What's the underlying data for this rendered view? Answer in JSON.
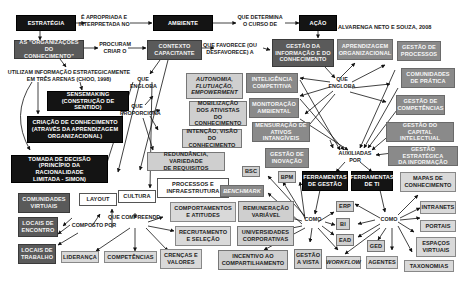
{
  "citation": "ALVARENGA NETO E SOUZA, 2008",
  "nodes": {
    "estrategia": "ESTRATÉGIA",
    "ambiente": "AMBIENTE",
    "acao": "AÇÃO",
    "organizacoes": "AS \"ORGANIZAÇÕES DO\nCONHECIMENTO\"",
    "contexto": "CONTEXTO\nCAPACITANTE",
    "gestao_info": "GESTÃO DA\nINFORMAÇÃO E DO\nCONHECIMENTO",
    "aprendizagem": "APRENDIZAGEM\nORGANIZACIONAL",
    "gestao_processos": "GESTÃO DE\nPROCESSOS",
    "comunidades_pratica": "COMUNIDADES\nDE PRÁTICA",
    "gestao_competencias": "GESTÃO DE\nCOMPETÊNCIAS",
    "capital_intelectual": "GESTÃO DO\nCAPITAL INTELECTUAL",
    "gestao_estrategica": "GESTÃO ESTRATÉGICA\nDA INFORMAÇÃO",
    "inteligencia": "INTELIGÊNCIA\nCOMPETITIVA",
    "monitoracao": "MONITORAÇÃO\nAMBIENTAL",
    "mensuracao": "MENSURAÇÃO DE\nATIVOS INTANGÍVEIS",
    "inovacao": "GESTÃO DE\nINOVAÇÃO",
    "autonomia": "AUTONOMIA,\nFLUTUAÇÃO,\nEMPOWERMENT",
    "mobilizacao": "MOBILIZAÇÃO\nDOS ATIVISTAS DO\nCONHECIMENTO",
    "intencao": "INTENÇÃO, VISÃO\nDO CONHECIMENTO",
    "redundancia": "REDUNDÂNCIA, VARIEDADE\nDE REQUISITOS",
    "sensemaking": "SENSEMAKING\n(CONSTRUÇÃO DE SENTIDO)",
    "criacao": "CRIAÇÃO DE CONHECIMENTO\n(ATRAVÉS DA APRENDIZAGEM\nORGANIZACIONAL)",
    "tomada": "TOMADA DE DECISÃO\n(PRINCÍPIO DA RACIONALIDADE\nLIMITADA - SIMON)",
    "comunidades_virtuais": "COMUNIDADES\nVIRTUAIS",
    "locais_encontro": "LOCAIS DE\nENCONTRO",
    "locais_trabalho": "LOCAIS DE\nTRABALHO",
    "layout": "LAYOUT",
    "cultura": "CULTURA",
    "processos_infra": "PROCESSOS E\nINFRAESTRUTURA",
    "lideranca": "LIDERANÇA",
    "competencias": "COMPETÊNCIAS",
    "crencas": "CRENÇAS E\nVALORES",
    "comportamentos": "COMPORTAMENTOS\nE ATITUDES",
    "recrutamento": "RECRUTAMENTO\nE SELEÇÃO",
    "benchmark": "BENCHMARK",
    "bsc": "BSC",
    "bpm": "BPM",
    "remuneracao": "REMUNERAÇÃO\nVARIÁVEL",
    "universidades": "UNIVERSIDADES\nCORPORATIVAS",
    "incentivo": "INCENTIVO AO\nCOMPARTILHAMENTO",
    "gestao_vista": "GESTÃO\nA VISTA",
    "ferr_gestao": "FERRAMENTAS\nDE GESTÃO",
    "ferr_ti": "FERRAMENTAS\nDE TI",
    "mapas": "MAPAS DE\nCONHECIMENTO",
    "erp": "ERP",
    "bi": "BI",
    "ead": "EAD",
    "ged": "GED",
    "workflow": "WORKFLOW",
    "agentes": "AGENTES",
    "intranets": "INTRANETS",
    "portais": "PORTAIS",
    "espacos": "ESPAÇOS\nVIRTUAIS",
    "taxonomias": "TAXONOMIAS"
  },
  "labels": {
    "apropriada": "É APROPRIADA E\nINTERPRETADA NO",
    "determina": "QUE DETERMINA\nO CURSO DE",
    "procuram": "PROCURAM\nCRIAR O",
    "favorece": "QUE FAVORECE (OU\nDESFAVORECE) A",
    "utilizam": "UTILIZAM INFORMAÇÃO ESTRATEGICAMENTE\nEM TRÊS ARENAS (CHOO, 1998)",
    "engloba1": "QUE\nENGLOBA",
    "proporciona": "QUE\nPROPORCIONA",
    "engloba2": "QUE\nENGLOBA",
    "auxiliadas": "AUXILIADAS\nPOR",
    "composto": "COMPOSTO POR",
    "compreende": "QUE COMPREENDE",
    "como1": "COMO",
    "como2": "COMO"
  }
}
